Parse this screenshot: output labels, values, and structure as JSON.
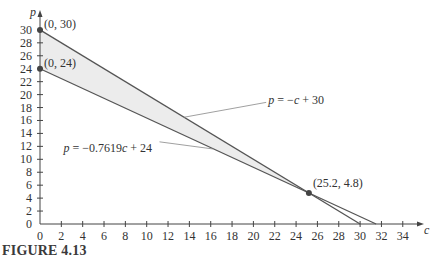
{
  "caption": "FIGURE 4.13",
  "chart_data": {
    "type": "line",
    "title": "",
    "xlabel": "c",
    "ylabel": "p",
    "xlim": [
      0,
      35
    ],
    "ylim": [
      0,
      31
    ],
    "grid": false,
    "x_ticks": [
      0,
      2,
      4,
      6,
      8,
      10,
      12,
      14,
      16,
      18,
      20,
      22,
      24,
      26,
      28,
      30,
      32,
      34
    ],
    "y_ticks": [
      0,
      2,
      4,
      6,
      8,
      10,
      12,
      14,
      16,
      18,
      20,
      22,
      24,
      26,
      28,
      30
    ],
    "series": [
      {
        "name": "p = −c + 30",
        "points": [
          [
            0,
            30
          ],
          [
            30,
            0
          ]
        ],
        "label_pos": [
          22.5,
          19
        ]
      },
      {
        "name": "p = −0.7619c + 24",
        "points": [
          [
            0,
            24
          ],
          [
            31.5,
            0
          ]
        ],
        "label_pos": [
          2.5,
          13
        ]
      }
    ],
    "shaded_region": {
      "between": [
        "p = −c + 30",
        "p = −0.7619c + 24"
      ],
      "x_range": [
        0,
        25.2
      ],
      "color": "#ececec"
    },
    "points": [
      {
        "label": "(0, 30)",
        "x": 0,
        "y": 30
      },
      {
        "label": "(0, 24)",
        "x": 0,
        "y": 24
      },
      {
        "label": "(25.2, 4.8)",
        "x": 25.2,
        "y": 4.8
      }
    ],
    "colors": {
      "line": "#555555",
      "point": "#444444",
      "fill": "#ececec"
    }
  }
}
